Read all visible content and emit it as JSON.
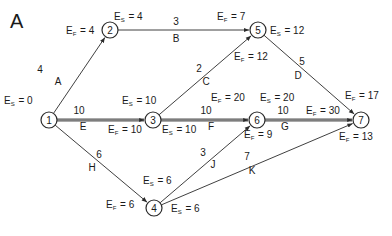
{
  "panel_label": "A",
  "colors": {
    "line": "#2a2a2a",
    "critical": "#555555",
    "background": "#ffffff"
  },
  "nodes": [
    {
      "id": "1",
      "x": 49,
      "y": 120
    },
    {
      "id": "2",
      "x": 110,
      "y": 30
    },
    {
      "id": "3",
      "x": 153,
      "y": 120
    },
    {
      "id": "4",
      "x": 154,
      "y": 208
    },
    {
      "id": "5",
      "x": 258,
      "y": 30
    },
    {
      "id": "6",
      "x": 257,
      "y": 120
    },
    {
      "id": "7",
      "x": 361,
      "y": 120
    }
  ],
  "activities": [
    {
      "name": "A",
      "from": "1",
      "to": "2",
      "duration": "4",
      "critical": false,
      "dur_pos": [
        40,
        73
      ],
      "name_pos": [
        58,
        85
      ]
    },
    {
      "name": "B",
      "from": "2",
      "to": "5",
      "duration": "3",
      "critical": false,
      "dur_pos": [
        176,
        25
      ],
      "name_pos": [
        176,
        42
      ]
    },
    {
      "name": "C",
      "from": "3",
      "to": "5",
      "duration": "2",
      "critical": false,
      "dur_pos": [
        199,
        72
      ],
      "name_pos": [
        206,
        85
      ]
    },
    {
      "name": "D",
      "from": "5",
      "to": "7",
      "duration": "5",
      "critical": false,
      "dur_pos": [
        302,
        65
      ],
      "name_pos": [
        298,
        79
      ]
    },
    {
      "name": "E",
      "from": "1",
      "to": "3",
      "duration": "10",
      "critical": true,
      "dur_pos": [
        79,
        114
      ],
      "name_pos": [
        83,
        130
      ]
    },
    {
      "name": "F",
      "from": "3",
      "to": "6",
      "duration": "10",
      "critical": true,
      "dur_pos": [
        206,
        114
      ],
      "name_pos": [
        211,
        130
      ]
    },
    {
      "name": "G",
      "from": "6",
      "to": "7",
      "duration": "10",
      "critical": true,
      "dur_pos": [
        283,
        114
      ],
      "name_pos": [
        285,
        130
      ]
    },
    {
      "name": "H",
      "from": "1",
      "to": "4",
      "duration": "6",
      "critical": false,
      "dur_pos": [
        99,
        158
      ],
      "name_pos": [
        92,
        171
      ]
    },
    {
      "name": "J",
      "from": "4",
      "to": "6",
      "duration": "3",
      "critical": false,
      "dur_pos": [
        203,
        156
      ],
      "name_pos": [
        213,
        168
      ]
    },
    {
      "name": "K",
      "from": "4",
      "to": "7",
      "duration": "7",
      "critical": false,
      "dur_pos": [
        247,
        160
      ],
      "name_pos": [
        252,
        174
      ]
    }
  ],
  "annotations": [
    {
      "kind": "S",
      "value": "0",
      "x": 4,
      "y": 104
    },
    {
      "kind": "F",
      "value": "4",
      "x": 66,
      "y": 34
    },
    {
      "kind": "S",
      "value": "4",
      "x": 114,
      "y": 20
    },
    {
      "kind": "F",
      "value": "7",
      "x": 217,
      "y": 20
    },
    {
      "kind": "S",
      "value": "12",
      "x": 270,
      "y": 34
    },
    {
      "kind": "F",
      "value": "12",
      "x": 234,
      "y": 60
    },
    {
      "kind": "F",
      "value": "17",
      "x": 345,
      "y": 99
    },
    {
      "kind": "S",
      "value": "10",
      "x": 122,
      "y": 104
    },
    {
      "kind": "F",
      "value": "20",
      "x": 211,
      "y": 101
    },
    {
      "kind": "S",
      "value": "20",
      "x": 260,
      "y": 101
    },
    {
      "kind": "F",
      "value": "30",
      "x": 306,
      "y": 114
    },
    {
      "kind": "F",
      "value": "10",
      "x": 108,
      "y": 133
    },
    {
      "kind": "S",
      "value": "10",
      "x": 162,
      "y": 133
    },
    {
      "kind": "F",
      "value": "9",
      "x": 244,
      "y": 138
    },
    {
      "kind": "F",
      "value": "13",
      "x": 339,
      "y": 140
    },
    {
      "kind": "S",
      "value": "6",
      "x": 143,
      "y": 184
    },
    {
      "kind": "F",
      "value": "6",
      "x": 106,
      "y": 208
    },
    {
      "kind": "S",
      "value": "6",
      "x": 171,
      "y": 212
    }
  ]
}
